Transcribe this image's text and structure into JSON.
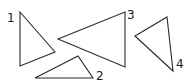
{
  "diagram": {
    "stroke_color": "#2a2a2a",
    "background": "#ffffff",
    "triangles": [
      {
        "label": "1",
        "points": "20,12 55,52 20,66",
        "label_pos": [
          7,
          22
        ]
      },
      {
        "label": "2",
        "points": "35,78 78,56 93,78",
        "label_pos": [
          96,
          80
        ]
      },
      {
        "label": "3",
        "points": "58,39 125,12 125,67",
        "label_pos": [
          127,
          19
        ]
      },
      {
        "label": "4",
        "points": "135,36 167,17 173,71",
        "label_pos": [
          176,
          68
        ]
      }
    ]
  }
}
